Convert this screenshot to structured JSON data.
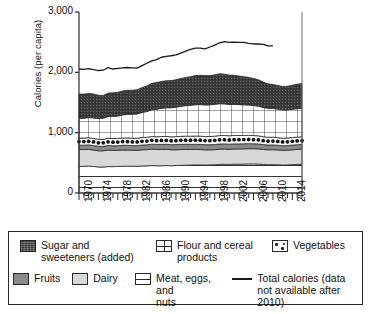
{
  "chart_data": {
    "type": "area",
    "title": "",
    "subtitle": "",
    "xlabel": "",
    "ylabel": "Calories (per capita)",
    "ylim": [
      0,
      3000
    ],
    "yticks": [
      "0",
      "1,000",
      "2,000",
      "3,000"
    ],
    "ytick_values": [
      0,
      1000,
      2000,
      3000
    ],
    "xlim": [
      1970,
      2016
    ],
    "xticks": [
      "1970",
      "1974",
      "1978",
      "1982",
      "1986",
      "1990",
      "1994",
      "1998",
      "2002",
      "2006",
      "2010",
      "2014"
    ],
    "xtick_values": [
      1970,
      1974,
      1978,
      1982,
      1986,
      1990,
      1994,
      1998,
      2002,
      2006,
      2010,
      2014
    ],
    "grid": false,
    "legend_position": "below",
    "stacked": true,
    "x": [
      1970,
      1971,
      1972,
      1973,
      1974,
      1975,
      1976,
      1977,
      1978,
      1979,
      1980,
      1981,
      1982,
      1983,
      1984,
      1985,
      1986,
      1987,
      1988,
      1989,
      1990,
      1991,
      1992,
      1993,
      1994,
      1995,
      1996,
      1997,
      1998,
      1999,
      2000,
      2001,
      2002,
      2003,
      2004,
      2005,
      2006,
      2007,
      2008,
      2009,
      2010,
      2011,
      2012,
      2013,
      2014,
      2015,
      2016
    ],
    "stack_order_bottom_to_top": [
      "Meat, eggs, and nuts",
      "Dairy",
      "Fruits",
      "Vegetables",
      "Flour and cereal products",
      "Sugar and sweeteners (added)"
    ],
    "series": [
      {
        "name": "Meat, eggs, and nuts",
        "pattern": "horizontal-lines",
        "color": "#ffffff",
        "values": [
          440,
          442,
          446,
          440,
          432,
          430,
          438,
          437,
          440,
          443,
          444,
          444,
          443,
          448,
          450,
          455,
          452,
          452,
          455,
          452,
          455,
          458,
          462,
          463,
          466,
          466,
          464,
          465,
          468,
          474,
          476,
          474,
          478,
          478,
          480,
          482,
          482,
          480,
          474,
          470,
          470,
          468,
          464,
          466,
          470,
          474,
          476
        ]
      },
      {
        "name": "Dairy",
        "pattern": "solid",
        "color": "#d8d8d8",
        "values": [
          281,
          278,
          277,
          272,
          268,
          270,
          274,
          270,
          268,
          270,
          268,
          265,
          264,
          268,
          268,
          272,
          270,
          270,
          268,
          265,
          262,
          262,
          260,
          258,
          256,
          254,
          252,
          250,
          250,
          252,
          252,
          250,
          252,
          252,
          252,
          253,
          252,
          252,
          248,
          246,
          248,
          246,
          243,
          244,
          246,
          248,
          250
        ]
      },
      {
        "name": "Fruits",
        "pattern": "solid",
        "color": "#8a8a8a",
        "values": [
          72,
          73,
          74,
          75,
          74,
          73,
          76,
          76,
          76,
          78,
          78,
          77,
          78,
          79,
          80,
          82,
          82,
          84,
          84,
          84,
          85,
          86,
          86,
          86,
          86,
          86,
          85,
          85,
          86,
          86,
          86,
          85,
          84,
          84,
          84,
          83,
          82,
          82,
          80,
          79,
          79,
          78,
          77,
          77,
          78,
          78,
          78
        ]
      },
      {
        "name": "Vegetables",
        "pattern": "dots",
        "color": "#ffffff",
        "values": [
          118,
          118,
          119,
          118,
          116,
          116,
          120,
          120,
          120,
          122,
          122,
          122,
          122,
          124,
          125,
          128,
          128,
          130,
          130,
          130,
          132,
          133,
          134,
          134,
          136,
          136,
          135,
          136,
          138,
          140,
          140,
          139,
          140,
          139,
          138,
          137,
          136,
          134,
          130,
          128,
          128,
          126,
          124,
          124,
          125,
          126,
          127
        ]
      },
      {
        "name": "Flour and cereal products",
        "pattern": "grid",
        "color": "#ffffff",
        "values": [
          326,
          330,
          334,
          340,
          344,
          352,
          360,
          368,
          372,
          382,
          392,
          398,
          404,
          416,
          428,
          444,
          456,
          468,
          476,
          482,
          490,
          498,
          506,
          512,
          520,
          524,
          524,
          526,
          530,
          528,
          524,
          520,
          516,
          512,
          508,
          504,
          498,
          492,
          486,
          482,
          478,
          474,
          470,
          468,
          470,
          472,
          474
        ]
      },
      {
        "name": "Sugar and sweeteners (added)",
        "pattern": "dark-texture",
        "color": "#3b3b3b",
        "values": [
          402,
          398,
          400,
          396,
          386,
          376,
          388,
          390,
          392,
          396,
          398,
          398,
          400,
          412,
          424,
          436,
          442,
          444,
          448,
          450,
          452,
          460,
          468,
          474,
          482,
          486,
          486,
          484,
          488,
          496,
          492,
          486,
          482,
          474,
          466,
          458,
          448,
          438,
          420,
          404,
          396,
          390,
          386,
          390,
          398,
          404,
          410
        ]
      }
    ],
    "line_series": {
      "name": "Total calories (data not available after 2010)",
      "color": "#1a1a1a",
      "x": [
        1970,
        1971,
        1972,
        1973,
        1974,
        1975,
        1976,
        1977,
        1978,
        1979,
        1980,
        1981,
        1982,
        1983,
        1984,
        1985,
        1986,
        1987,
        1988,
        1989,
        1990,
        1991,
        1992,
        1993,
        1994,
        1995,
        1996,
        1997,
        1998,
        1999,
        2000,
        2001,
        2002,
        2003,
        2004,
        2005,
        2006,
        2007,
        2008,
        2009,
        2010
      ],
      "values": [
        2055,
        2050,
        2060,
        2045,
        2030,
        2035,
        2080,
        2055,
        2065,
        2075,
        2080,
        2075,
        2070,
        2110,
        2150,
        2190,
        2210,
        2250,
        2265,
        2275,
        2290,
        2320,
        2350,
        2380,
        2400,
        2400,
        2390,
        2420,
        2450,
        2490,
        2510,
        2495,
        2500,
        2495,
        2495,
        2480,
        2470,
        2470,
        2465,
        2440,
        2440
      ]
    }
  },
  "legend": {
    "items": [
      {
        "label": "Sugar and\nsweeteners (added)",
        "swatch": "sugar-swatch"
      },
      {
        "label": "Flour and cereal\nproducts",
        "swatch": "flour-swatch"
      },
      {
        "label": "Vegetables",
        "swatch": "vegetables-swatch"
      },
      {
        "label": "Fruits",
        "swatch": "fruits-swatch"
      },
      {
        "label": "Dairy",
        "swatch": "dairy-swatch"
      },
      {
        "label": "Meat, eggs, and\nnuts",
        "swatch": "meat-swatch"
      },
      {
        "label": "Total calories (data\nnot available after 2010)",
        "swatch": "total-line-swatch"
      }
    ]
  },
  "colors": {
    "sugar": "#3b3b3b",
    "fruits": "#8a8a8a",
    "dairy": "#d8d8d8",
    "axis": "#2b2b2b",
    "line": "#1a1a1a",
    "background": "#ffffff"
  }
}
